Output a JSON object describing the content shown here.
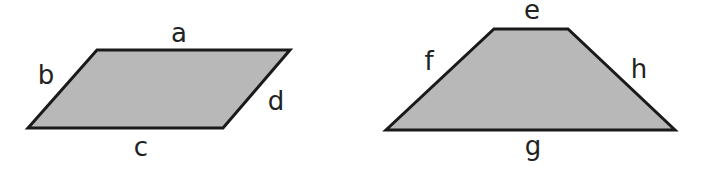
{
  "figure": {
    "background": "#ffffff",
    "fill_color": "#b8b8b8",
    "stroke_color": "#1a1a1a"
  },
  "shapes": [
    {
      "type": "parallelogram",
      "vertices": [
        [
          97,
          50
        ],
        [
          290,
          50
        ],
        [
          223,
          128
        ],
        [
          28,
          128
        ]
      ],
      "sides": {
        "top": "a",
        "left": "b",
        "bottom": "c",
        "right": "d"
      }
    },
    {
      "type": "trapezoid",
      "vertices": [
        [
          494,
          29
        ],
        [
          568,
          29
        ],
        [
          675,
          130
        ],
        [
          386,
          130
        ]
      ],
      "sides": {
        "top": "e",
        "left": "f",
        "bottom": "g",
        "right": "h"
      }
    }
  ]
}
